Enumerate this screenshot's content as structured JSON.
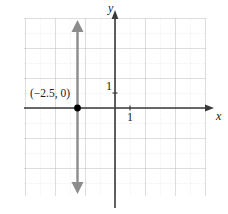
{
  "figure": {
    "kind": "cartesian-coordinate-plane",
    "axes": {
      "x_axis_label": "x",
      "y_axis_label": "y",
      "x_tick_label": "1",
      "y_tick_label": "1",
      "x_range": [
        -6,
        6
      ],
      "y_range": [
        -6,
        6
      ],
      "unit_px": 15,
      "origin_px": [
        115,
        108
      ],
      "axis_color": "#3a3a3a",
      "grid_minor_color": "#d8d8d8",
      "grid_major_color": "#c0c0c0",
      "grid_bounds_px": [
        24,
        18,
        206,
        196
      ]
    },
    "graph": {
      "description": "vertical line x = -2.5",
      "equation_x": -2.5,
      "line_color": "#8c8c8c",
      "arrow_top": true,
      "arrow_bottom": true
    },
    "annotation": {
      "point_label": "(−2.5, 0)",
      "point_x": -2.5,
      "point_y": 0,
      "point_color": "#000000"
    }
  }
}
